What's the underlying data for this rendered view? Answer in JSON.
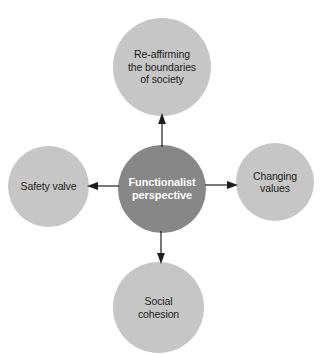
{
  "diagram": {
    "type": "radial-spoke",
    "background_color": "#ffffff",
    "center": {
      "id": "functionalist-perspective",
      "label": "Functionalist\nperspective",
      "fill_color": "#878787",
      "text_color": "#ffffff"
    },
    "nodes": [
      {
        "id": "re-affirming-boundaries",
        "position": "top",
        "label": "Re-affirming\nthe boundaries\nof society",
        "fill_color": "#c6c6c6",
        "text_color": "#1d1d1b"
      },
      {
        "id": "changing-values",
        "position": "right",
        "label": "Changing\nvalues",
        "fill_color": "#c6c6c6",
        "text_color": "#1d1d1b"
      },
      {
        "id": "social-cohesion",
        "position": "bottom",
        "label": "Social\ncohesion",
        "fill_color": "#c6c6c6",
        "text_color": "#1d1d1b"
      },
      {
        "id": "safety-valve",
        "position": "left",
        "label": "Safety valve",
        "fill_color": "#c6c6c6",
        "text_color": "#1d1d1b"
      }
    ],
    "connectors": [
      {
        "id": "arrow-up",
        "from": "functionalist-perspective",
        "to": "re-affirming-boundaries",
        "direction": "up",
        "color": "#1d1d1b"
      },
      {
        "id": "arrow-right",
        "from": "functionalist-perspective",
        "to": "changing-values",
        "direction": "right",
        "color": "#1d1d1b"
      },
      {
        "id": "arrow-down",
        "from": "functionalist-perspective",
        "to": "social-cohesion",
        "direction": "down",
        "color": "#1d1d1b"
      },
      {
        "id": "arrow-left",
        "from": "functionalist-perspective",
        "to": "safety-valve",
        "direction": "left",
        "color": "#1d1d1b"
      }
    ]
  }
}
